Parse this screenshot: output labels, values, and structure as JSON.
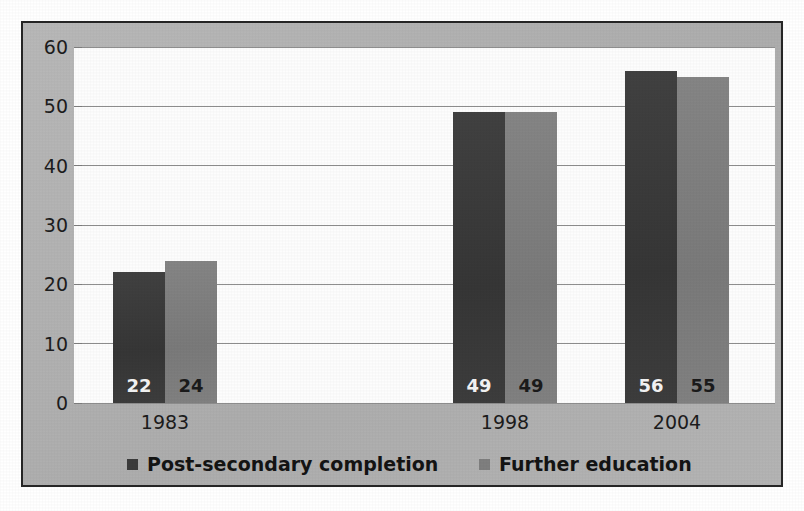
{
  "chart_data": {
    "type": "bar",
    "title": "",
    "subtitle": "",
    "xlabel": "",
    "ylabel": "",
    "categories": [
      "1983",
      "1998",
      "2004"
    ],
    "series": [
      {
        "name": "Post-secondary completion",
        "color": "#3b3b3b",
        "values": [
          22,
          49,
          56
        ],
        "value_labels": [
          "22",
          "49",
          "56"
        ]
      },
      {
        "name": "Further education",
        "color": "#7f7f7f",
        "values": [
          24,
          49,
          55
        ],
        "value_labels": [
          "24",
          "49",
          "55"
        ]
      }
    ],
    "ylim": [
      0,
      60
    ],
    "yticks": [
      0,
      10,
      20,
      30,
      40,
      50,
      60
    ],
    "ytick_labels": [
      "0",
      "10",
      "20",
      "30",
      "40",
      "50",
      "60"
    ],
    "grid": true,
    "grid_axis": "y",
    "legend_position": "bottom",
    "data_labels": true,
    "data_labels_position": "inside-base"
  },
  "legend": {
    "entries": [
      {
        "label": "Post-secondary completion",
        "swatch_color": "#3b3b3b",
        "left_px": 127
      },
      {
        "label": "Further education",
        "swatch_color": "#7f7f7f",
        "left_px": 479
      }
    ]
  },
  "colors": {
    "frame_border": "#262626",
    "chart_background": "#b2b2b2",
    "plot_background": "#fdfdfd",
    "gridline": "#8e8e8e",
    "series_dark": "#3b3b3b",
    "series_light": "#7f7f7f",
    "text": "#1c1c1c",
    "label_on_dark": "#f4f4f4",
    "label_on_light": "#1b1b1b"
  },
  "geometry": {
    "plot_left": 74,
    "plot_top": 47,
    "plot_width": 701,
    "plot_height": 356,
    "group_centers": [
      165,
      505,
      677
    ],
    "bar_width": 52,
    "category_label_width": 160
  }
}
